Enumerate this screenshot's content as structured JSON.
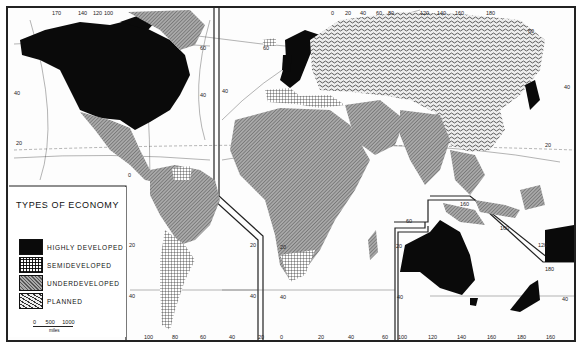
{
  "map": {
    "title": "TYPES OF ECONOMY",
    "legend": [
      {
        "key": "highly_developed",
        "label": "HIGHLY DEVELOPED",
        "pattern": "solid-black",
        "color": "#0a0a0a"
      },
      {
        "key": "semideveloped",
        "label": "SEMIDEVELOPED",
        "pattern": "fine-grid",
        "color": "#ffffff"
      },
      {
        "key": "underdeveloped",
        "label": "UNDERDEVELOPED",
        "pattern": "diagonal-hatch-gray",
        "color": "#9a9a9a"
      },
      {
        "key": "planned",
        "label": "PLANNED",
        "pattern": "wavy-stipple",
        "color": "#d8d8d8"
      }
    ],
    "scale": {
      "ticks": [
        "0",
        "500",
        "1000"
      ],
      "unit": "miles"
    },
    "regions": {
      "north_america": {
        "top_labels": [
          "170",
          "140",
          "120",
          "100"
        ],
        "lat_labels": [
          "60",
          "40",
          "20"
        ]
      },
      "europe_asia": {
        "top_labels": [
          "60",
          "0",
          "20",
          "40",
          "60",
          "80",
          "120",
          "140",
          "160",
          "180"
        ],
        "lat_labels": [
          "60",
          "40",
          "20"
        ]
      },
      "south_america": {
        "bottom_labels": [
          "100",
          "80",
          "60",
          "40",
          "20"
        ],
        "lat_labels": [
          "0",
          "20",
          "40"
        ]
      },
      "africa": {
        "bottom_labels": [
          "0",
          "20",
          "40",
          "60"
        ],
        "lat_labels": [
          "20",
          "40"
        ]
      },
      "oceania": {
        "bottom_labels": [
          "100",
          "120",
          "140",
          "160",
          "180",
          "160"
        ],
        "lat_labels": [
          "20",
          "40",
          "40"
        ],
        "inner_labels": [
          "160",
          "120",
          "180"
        ]
      }
    },
    "classification": {
      "highly_developed": [
        "North America (USA, Canada)",
        "Western Europe",
        "Scandinavia",
        "Australia",
        "New Zealand",
        "Japan"
      ],
      "semideveloped": [
        "Southern South America",
        "Venezuela",
        "South Africa",
        "Southern Europe",
        "Iceland",
        "Finland"
      ],
      "underdeveloped": [
        "Mexico & Central America",
        "Brazil & northern South America",
        "Africa",
        "Middle East",
        "South Asia",
        "Southeast Asia",
        "Greenland"
      ],
      "planned": [
        "USSR",
        "Eastern Europe",
        "China",
        "Mongolia"
      ]
    }
  }
}
